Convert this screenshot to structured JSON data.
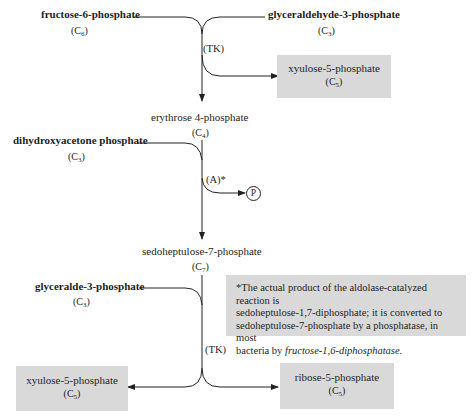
{
  "diagram": {
    "colors": {
      "line": "#222222",
      "box_fill": "#d9d9d9",
      "text": "#1e1e1e"
    },
    "step1": {
      "substrate_left": {
        "name": "fructose-6-phosphate",
        "carbons": "C",
        "carbons_sub": "6"
      },
      "substrate_right": {
        "name": "glyceraldehyde-3-phosphate",
        "carbons": "C",
        "carbons_sub": "3"
      },
      "enzyme": "(TK)",
      "product_box": {
        "name": "xyulose-5-phosphate",
        "carbons": "C",
        "carbons_sub": "5"
      },
      "product_main": {
        "name": "erythrose 4-phosphate",
        "carbons": "C",
        "carbons_sub": "4"
      }
    },
    "step2": {
      "substrate_left": {
        "name": "dihydroxyacetone phosphate",
        "carbons": "C",
        "carbons_sub": "3"
      },
      "enzyme": "(A)*",
      "side_product": "P",
      "product_main": {
        "name": "sedoheptulose-7-phosphate",
        "carbons": "C",
        "carbons_sub": "7"
      }
    },
    "step3": {
      "substrate_left": {
        "name": "glyceralde-3-phosphate",
        "carbons": "C",
        "carbons_sub": "3"
      },
      "enzyme": "(TK)",
      "product_left_box": {
        "name": "xyulose-5-phosphate",
        "carbons": "C",
        "carbons_sub": "5"
      },
      "product_right_box": {
        "name": "ribose-5-phosphate",
        "carbons": "C",
        "carbons_sub": "5"
      }
    },
    "footnote": {
      "line1": "*The actual product of the aldolase-catalyzed reaction is",
      "line2": "sedoheptulose-1,7-diphosphate; it is converted to",
      "line3": "sedoheptulose-7-phosphate by a phosphatase, in most",
      "line4_prefix": "bacteria by ",
      "line4_italic": "fructose-1,6-diphosphatase",
      "line4_suffix": "."
    }
  }
}
